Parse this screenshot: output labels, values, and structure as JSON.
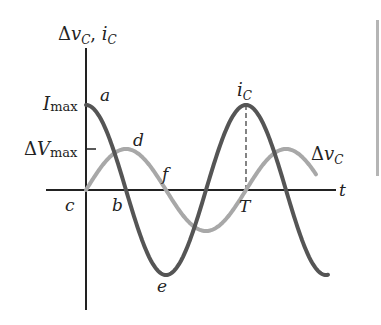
{
  "diagram": {
    "type": "waveform",
    "y_axis_label": "Δv_C, i_C",
    "x_axis_label": "t",
    "y_ticks": [
      {
        "label": "I_max",
        "refers_to": "i_C peak"
      },
      {
        "label": "ΔV_max",
        "refers_to": "Δv_C peak"
      }
    ],
    "period_marker": "T",
    "curves": [
      {
        "name": "i_C",
        "label": "i_C",
        "shape": "cosine",
        "color": "#555555",
        "amplitude_label": "I_max"
      },
      {
        "name": "Δv_C",
        "label": "Δv_C",
        "shape": "sine",
        "color": "#a8a8a8",
        "amplitude_label": "ΔV_max"
      }
    ],
    "point_labels": [
      "a",
      "b",
      "c",
      "d",
      "e",
      "f"
    ],
    "colors": {
      "axis": "#222222",
      "current": "#555555",
      "voltage": "#a8a8a8",
      "sidebar": "#b5b5b5"
    }
  },
  "labels": {
    "y_axis_delta": "Δ",
    "y_axis_v": "v",
    "y_axis_sub_c": "C",
    "y_axis_comma": ", ",
    "y_axis_i": "i",
    "imax_i": "I",
    "imax_sub": "max",
    "dvmax_delta": "Δ",
    "dvmax_v": "V",
    "dvmax_sub": "max",
    "a": "a",
    "b": "b",
    "c": "c",
    "d": "d",
    "e": "e",
    "f": "f",
    "t": "t",
    "T": "T",
    "ic_i": "i",
    "ic_sub": "C",
    "dvc_delta": "Δ",
    "dvc_v": "v",
    "dvc_sub": "C"
  }
}
